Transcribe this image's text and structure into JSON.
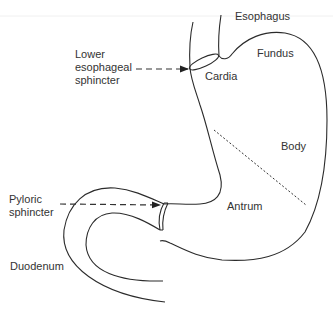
{
  "diagram": {
    "type": "anatomy-stomach",
    "labels": {
      "esophagus": "Esophagus",
      "fundus": "Fundus",
      "cardia": "Cardia",
      "body": "Body",
      "antrum": "Antrum",
      "duodenum": "Duodenum",
      "les_line1": "Lower",
      "les_line2": "esophageal",
      "les_line3": "sphincter",
      "pyloric_line1": "Pyloric",
      "pyloric_line2": "sphincter"
    },
    "colors": {
      "line": "#2b2b2b",
      "text": "#333333",
      "background": "#ffffff"
    }
  }
}
